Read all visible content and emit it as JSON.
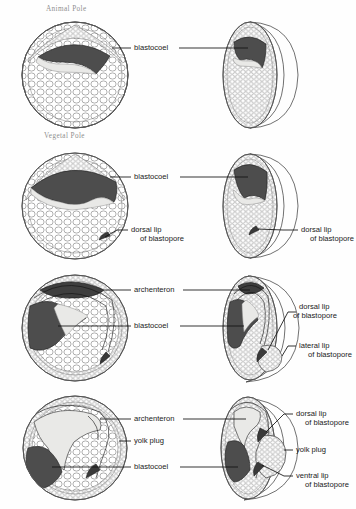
{
  "figure": {
    "pole_labels": [
      {
        "text": "Animal Pole"
      },
      {
        "text": "Vegetal Pole"
      }
    ],
    "colors": {
      "blastocoel_fill": "#4d4d4d",
      "archenteron_fill": "#3f3f3f",
      "yolk_light": "#e9e9e7",
      "cell_outline": "#6e6e6e",
      "leader_line": "#111111",
      "pole_text": "#8e8e8e",
      "label_text": "#1a1a1a",
      "background": "#ffffff"
    }
  },
  "stages": [
    {
      "index": 1,
      "name": "blastula",
      "left_labels": [
        {
          "name": "blastocoel",
          "line1": "blastocoel",
          "line2": ""
        }
      ],
      "right_labels": []
    },
    {
      "index": 2,
      "name": "early-gastrula",
      "left_labels": [
        {
          "name": "blastocoel",
          "line1": "blastocoel",
          "line2": ""
        },
        {
          "name": "dorsal-lip-of-blastopore",
          "line1": "dorsal lip",
          "line2": "of blastopore"
        }
      ],
      "right_labels": [
        {
          "name": "dorsal-lip-of-blastopore",
          "line1": "dorsal lip",
          "line2": "of blastopore"
        }
      ]
    },
    {
      "index": 3,
      "name": "mid-gastrula",
      "left_labels": [
        {
          "name": "archenteron",
          "line1": "archenteron",
          "line2": ""
        },
        {
          "name": "blastocoel",
          "line1": "blastocoel",
          "line2": ""
        }
      ],
      "right_labels": [
        {
          "name": "dorsal-lip-of-blastopore",
          "line1": "dorsal lip",
          "line2": "of blastopore"
        },
        {
          "name": "lateral-lip-of-blastopore",
          "line1": "lateral lip",
          "line2": "of blastopore"
        }
      ]
    },
    {
      "index": 4,
      "name": "late-gastrula",
      "left_labels": [
        {
          "name": "archenteron",
          "line1": "archenteron",
          "line2": ""
        },
        {
          "name": "yolk-plug",
          "line1": "yolk plug",
          "line2": ""
        },
        {
          "name": "blastocoel",
          "line1": "blastocoel",
          "line2": ""
        }
      ],
      "right_labels": [
        {
          "name": "dorsal-lip-of-blastopore",
          "line1": "dorsal lip",
          "line2": "of blastopore"
        },
        {
          "name": "yolk-plug",
          "line1": "yolk plug",
          "line2": ""
        },
        {
          "name": "ventral-lip-of-blastopore",
          "line1": "ventral lip",
          "line2": "of blastopore"
        }
      ]
    }
  ]
}
